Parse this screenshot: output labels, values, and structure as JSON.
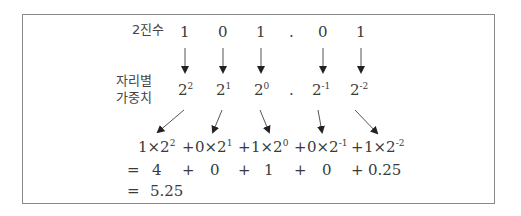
{
  "labels": {
    "binary": "2진수",
    "weight_line1": "자리별",
    "weight_line2": "가중치"
  },
  "binary_digits": [
    "1",
    "0",
    "1",
    ".",
    "0",
    "1"
  ],
  "weights": [
    {
      "base": "2",
      "exp": "2"
    },
    {
      "base": "2",
      "exp": "1"
    },
    {
      "base": "2",
      "exp": "0"
    },
    {
      "base": ".",
      "exp": ""
    },
    {
      "base": "2",
      "exp": "-1"
    },
    {
      "base": "2",
      "exp": "-2"
    }
  ],
  "expansion": {
    "terms": [
      {
        "coef": "1×2",
        "exp": "2"
      },
      {
        "coef": "0×2",
        "exp": "1"
      },
      {
        "coef": "1×2",
        "exp": "0"
      },
      {
        "coef": "0×2",
        "exp": "-1"
      },
      {
        "coef": "1×2",
        "exp": "-2"
      }
    ],
    "plus": "+",
    "values": [
      "4",
      "0",
      "1",
      "0",
      "0.25"
    ],
    "equals": "=",
    "result": "5.25"
  }
}
